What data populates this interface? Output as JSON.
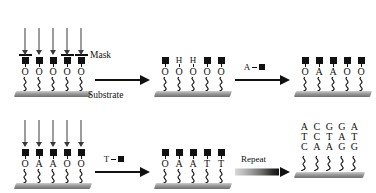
{
  "figure": {
    "labels": {
      "mask": "Mask",
      "substrate": "Substrate"
    },
    "colors": {
      "ink": "#111111",
      "light_arrow": "#3a3a3a",
      "substrate_top": "#cfcfcf",
      "substrate_bottom": "#6f6f6f"
    }
  },
  "glyphs": {
    "protecting_group": "black-square",
    "hydroxyl": "O",
    "deprotected": "H",
    "linker": "squiggle"
  },
  "panels": [
    {
      "id": "panel-1",
      "row": "top",
      "mask_present": true,
      "mask_bars": [
        true,
        false,
        false,
        true,
        true
      ],
      "light_arrows": [
        true,
        true,
        true,
        true,
        true
      ],
      "caps": [
        "square",
        "square",
        "square",
        "square",
        "square"
      ],
      "bases": [
        "O",
        "O",
        "O",
        "O",
        "O"
      ]
    },
    {
      "id": "panel-2",
      "row": "top",
      "mask_present": false,
      "light_arrows": [
        false,
        false,
        false,
        false,
        false
      ],
      "caps": [
        "square",
        "H",
        "H",
        "square",
        "square"
      ],
      "bases": [
        "O",
        "O",
        "O",
        "O",
        "O"
      ]
    },
    {
      "id": "panel-3",
      "row": "top",
      "mask_present": false,
      "light_arrows": [
        false,
        false,
        false,
        false,
        false
      ],
      "caps": [
        "square",
        "square",
        "square",
        "square",
        "square"
      ],
      "bases": [
        "O",
        "A",
        "A",
        "O",
        "O"
      ]
    },
    {
      "id": "panel-4",
      "row": "bottom",
      "mask_present": false,
      "light_arrows": [
        true,
        true,
        true,
        true,
        true
      ],
      "caps": [
        "square",
        "square",
        "square",
        "square",
        "square"
      ],
      "bases": [
        "O",
        "A",
        "A",
        "O",
        "O"
      ]
    },
    {
      "id": "panel-5",
      "row": "bottom",
      "mask_present": false,
      "light_arrows": [
        false,
        false,
        false,
        false,
        false
      ],
      "caps": [
        "square",
        "square",
        "square",
        "square",
        "square"
      ],
      "bases": [
        "O",
        "A",
        "A",
        "T",
        "T"
      ]
    }
  ],
  "arrows": [
    {
      "id": "arrow-1",
      "row": "top",
      "style": "plain",
      "label": ""
    },
    {
      "id": "arrow-2",
      "row": "top",
      "style": "plain",
      "label": "A",
      "reagent_symbol": "black-square"
    },
    {
      "id": "arrow-3",
      "row": "bottom",
      "style": "plain",
      "label": "T",
      "reagent_symbol": "black-square"
    },
    {
      "id": "arrow-4",
      "row": "bottom",
      "style": "gradient-taper",
      "label": "Repeat"
    }
  ],
  "final_array": {
    "id": "panel-6",
    "rows": [
      [
        "A",
        "C",
        "G",
        "G",
        "A"
      ],
      [
        "T",
        "C",
        "T",
        "A",
        "T"
      ],
      [
        "C",
        "A",
        "A",
        "G",
        "G"
      ]
    ]
  }
}
